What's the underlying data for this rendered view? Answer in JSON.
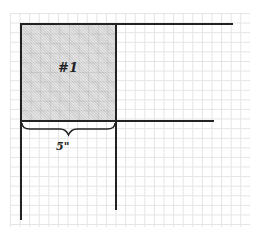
{
  "diagram": {
    "type": "graph-paper layout diagram",
    "region_label": "#1",
    "dimension_label": "5\"",
    "colors": {
      "line": "#222222",
      "grid": "#e4e4e4",
      "shade": "#d2d2d2",
      "background": "#ffffff"
    }
  }
}
